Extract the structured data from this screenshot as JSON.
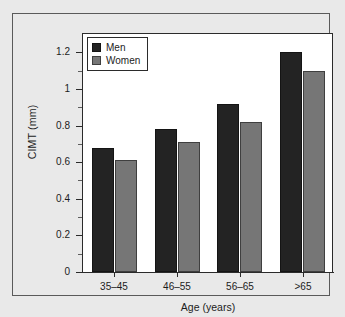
{
  "figure": {
    "background_color": "#e9e9e9",
    "plot_background_color": "#ffffff",
    "frame_color": "#5a5a5a",
    "axis_color": "#2b2b2b"
  },
  "legend": {
    "position": "top-left-inside",
    "entries": [
      {
        "label": "Men",
        "color": "#232323",
        "swatch_name": "legend-swatch-men"
      },
      {
        "label": "Women",
        "color": "#767676",
        "swatch_name": "legend-swatch-women"
      }
    ]
  },
  "chart_data": {
    "type": "bar",
    "title": "",
    "subtitle": "",
    "xlabel": "Age (years)",
    "ylabel": "CIMT (mm)",
    "categories": [
      "35–45",
      "46–55",
      "56–65",
      ">65"
    ],
    "series": [
      {
        "name": "Men",
        "color": "#232323",
        "values": [
          0.68,
          0.78,
          0.92,
          1.2
        ]
      },
      {
        "name": "Women",
        "color": "#767676",
        "values": [
          0.61,
          0.71,
          0.82,
          1.1
        ]
      }
    ],
    "ylim": [
      0,
      1.3
    ],
    "ytick_values": [
      0,
      0.2,
      0.4,
      0.6,
      0.8,
      1,
      1.2
    ],
    "ytick_labels": [
      "0",
      "0.2",
      "0.4",
      "0.6",
      "0.8",
      "1",
      "1.2"
    ],
    "yminor_tick_values": [
      0.1,
      0.3,
      0.5,
      0.7,
      0.9,
      1.1
    ],
    "grid": false,
    "legend_position": "upper left",
    "annotations": []
  }
}
